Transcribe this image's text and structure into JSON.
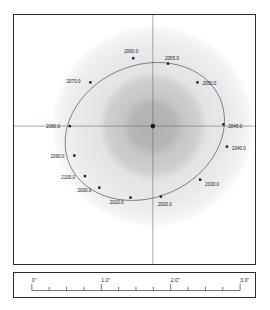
{
  "figure": {
    "kind": "binary-star-orbit-plot",
    "background_color": "#ffffff",
    "frame_color": "#2b2b2b"
  },
  "chart_data": {
    "type": "scatter",
    "title": "",
    "xlabel": "",
    "ylabel": "",
    "grid": false,
    "legend": "none",
    "axis_style": "crosshair-through-origin",
    "units": "arcsec",
    "xlim": [
      -1.55,
      1.55
    ],
    "ylim": [
      -1.55,
      1.55
    ],
    "primary_star": {
      "label": "",
      "x": 0.0,
      "y": 0.0,
      "marker": "filled-circle",
      "color": "#1a1a1a"
    },
    "halo": {
      "description": "diffuse point-spread-function glow centred on primary",
      "rings": [
        {
          "radius": 0.95,
          "color": "#ececec",
          "opacity": 1.0
        },
        {
          "radius": 0.78,
          "color": "#e4e4e4",
          "opacity": 1.0
        },
        {
          "radius": 0.46,
          "color": "#c9c9c9",
          "opacity": 1.0
        },
        {
          "radius": 0.24,
          "color": "#b3b3b3",
          "opacity": 1.0
        }
      ]
    },
    "orbit_ellipse": {
      "stroke": "#4a4a4a",
      "stroke_width": 0.6,
      "center_x": -0.09,
      "center_y": -0.06,
      "semi_major": 0.92,
      "semi_minor": 0.74,
      "rotation_deg": -24
    },
    "series": [
      {
        "name": "epoch markers",
        "marker": "filled-square",
        "color": "#1a1a1a",
        "points": [
          {
            "label": "2000.0",
            "x": -0.6,
            "y": -0.69,
            "label_dx": -22,
            "label_dy": 4
          },
          {
            "label": "2010.0",
            "x": -0.25,
            "y": -0.8,
            "label_dx": -21,
            "label_dy": 7
          },
          {
            "label": "2020.0",
            "x": 0.09,
            "y": -0.79,
            "label_dx": -3,
            "label_dy": 9
          },
          {
            "label": "2030.0",
            "x": 0.53,
            "y": -0.6,
            "label_dx": 5,
            "label_dy": 6
          },
          {
            "label": "2040.0",
            "x": 0.83,
            "y": -0.23,
            "label_dx": 5,
            "label_dy": 3
          },
          {
            "label": "2045.0",
            "x": 0.79,
            "y": 0.02,
            "label_dx": 5,
            "label_dy": 4
          },
          {
            "label": "2050.0",
            "x": 0.5,
            "y": 0.49,
            "label_dx": 5,
            "label_dy": 3
          },
          {
            "label": "2055.0",
            "x": 0.17,
            "y": 0.7,
            "label_dx": -3,
            "label_dy": -4
          },
          {
            "label": "2060.0",
            "x": -0.22,
            "y": 0.76,
            "label_dx": -9,
            "label_dy": -5
          },
          {
            "label": "2070.0",
            "x": -0.7,
            "y": 0.49,
            "label_dx": -24,
            "label_dy": 1
          },
          {
            "label": "2080.0",
            "x": -0.93,
            "y": 0.0,
            "label_dx": -24,
            "label_dy": 2
          },
          {
            "label": "2090.0",
            "x": -0.88,
            "y": -0.33,
            "label_dx": -24,
            "label_dy": 2
          },
          {
            "label": "2100.0",
            "x": -0.76,
            "y": -0.56,
            "label_dx": -24,
            "label_dy": 3
          }
        ]
      }
    ]
  },
  "scale_bar": {
    "axis_min": 0.0,
    "axis_max": 3.0,
    "major_ticks": [
      {
        "value": 0.0,
        "label": "0\""
      },
      {
        "value": 1.0,
        "label": "1.0\""
      },
      {
        "value": 2.0,
        "label": "2.0\""
      },
      {
        "value": 3.0,
        "label": "3.0\""
      }
    ],
    "minor_tick_step": 0.25,
    "line_color": "#4a4a4a"
  }
}
